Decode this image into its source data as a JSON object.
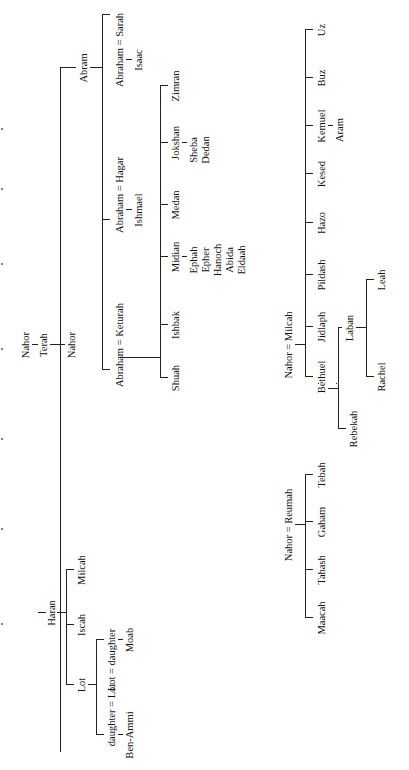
{
  "diagram": {
    "orientation": "rotated-90-ccw",
    "root": {
      "ancestor": "Nahor",
      "patriarch": "Terah",
      "sons": [
        "Abram",
        "Nahor",
        "Haran"
      ]
    },
    "abram_branch": {
      "label": "Abram",
      "unions": [
        {
          "label": "Abraham = Sarah",
          "children": [
            "Isaac"
          ]
        },
        {
          "label": "Abraham = Hagar",
          "children": [
            "Ishmael"
          ]
        },
        {
          "label": "Abraham = Keturah",
          "children": [
            {
              "name": "Zimran",
              "descendants": []
            },
            {
              "name": "Jokshan",
              "descendants": [
                "Sheba",
                "Dedan"
              ]
            },
            {
              "name": "Medan",
              "descendants": []
            },
            {
              "name": "Midian",
              "descendants": [
                "Ephah",
                "Epher",
                "Hanoch",
                "Abida",
                "Eldaah"
              ]
            },
            {
              "name": "Ishbak",
              "descendants": []
            },
            {
              "name": "Shuah",
              "descendants": []
            }
          ]
        }
      ]
    },
    "nahor_branch": {
      "label": "Nahor"
    },
    "haran_branch": {
      "label": "Haran",
      "children": [
        "Milcah",
        "Iscah",
        "Lot"
      ],
      "lot_unions": [
        {
          "label": "Lot = daughter",
          "children": [
            "Moab"
          ]
        },
        {
          "label": "daughter = Lot",
          "children": [
            "Ben-Ammi"
          ]
        }
      ]
    },
    "nahor_milcah": {
      "label": "Nahor = Milcah",
      "children": [
        "Uz",
        "Buz",
        "Kemuel",
        "Kesed",
        "Hazo",
        "Pildash",
        "Jidlaph",
        "Bethuel"
      ],
      "kemuel_child": "Aram",
      "bethuel_children": [
        "Laban",
        "Rebekah"
      ],
      "laban_children": [
        "Leah",
        "Rachel"
      ]
    },
    "nahor_reumah": {
      "label": "Nahor = Reumah",
      "children": [
        "Tebah",
        "Gaham",
        "Tahash",
        "Maacah"
      ]
    }
  }
}
